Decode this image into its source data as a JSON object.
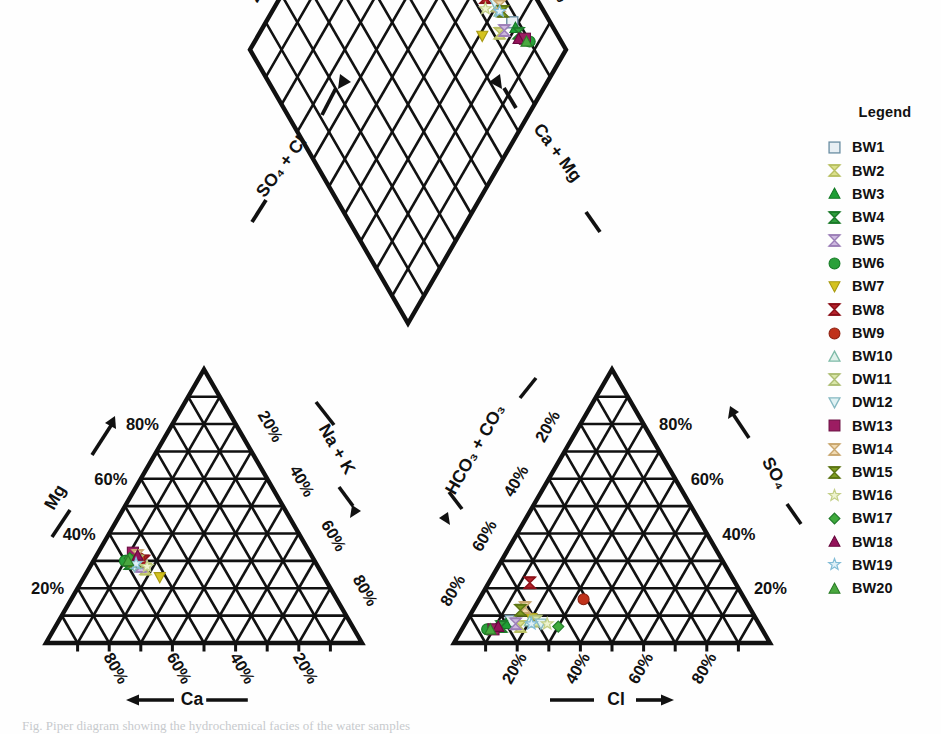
{
  "figure": {
    "type": "piper-trilinear-diagram",
    "caption": "Fig. Piper diagram showing the hydrochemical facies of the water samples"
  },
  "legend": {
    "title": "Legend",
    "items": [
      {
        "label": "BW1",
        "marker": "square-open",
        "color": "#e8eff4",
        "stroke": "#6b8ea3"
      },
      {
        "label": "BW2",
        "marker": "hourglass",
        "color": "#dbe08a",
        "stroke": "#b9c063"
      },
      {
        "label": "BW3",
        "marker": "triangle-up",
        "color": "#1f9e35",
        "stroke": "#147a26"
      },
      {
        "label": "BW4",
        "marker": "hourglass",
        "color": "#2f9e3d",
        "stroke": "#1c7a2a"
      },
      {
        "label": "BW5",
        "marker": "hourglass",
        "color": "#cdb8e0",
        "stroke": "#9c7fb8"
      },
      {
        "label": "BW6",
        "marker": "circle",
        "color": "#2aa03a",
        "stroke": "#157a24"
      },
      {
        "label": "BW7",
        "marker": "triangle-down",
        "color": "#d4c21f",
        "stroke": "#a89a12"
      },
      {
        "label": "BW8",
        "marker": "hourglass",
        "color": "#b5232c",
        "stroke": "#8c1018"
      },
      {
        "label": "BW9",
        "marker": "circle",
        "color": "#c0321b",
        "stroke": "#8d2010"
      },
      {
        "label": "BW10",
        "marker": "triangle-up-open",
        "color": "#dff1ea",
        "stroke": "#7fbba8"
      },
      {
        "label": "DW11",
        "marker": "hourglass",
        "color": "#d9e6a8",
        "stroke": "#aebe74"
      },
      {
        "label": "DW12",
        "marker": "triangle-down-open",
        "color": "#e0f2f4",
        "stroke": "#86b9c2"
      },
      {
        "label": "BW13",
        "marker": "square",
        "color": "#9c1c62",
        "stroke": "#6d0f43"
      },
      {
        "label": "BW14",
        "marker": "hourglass",
        "color": "#f0d9b0",
        "stroke": "#c9a76f"
      },
      {
        "label": "BW15",
        "marker": "hourglass",
        "color": "#7f9e22",
        "stroke": "#5d7515"
      },
      {
        "label": "BW16",
        "marker": "star-open",
        "color": "#eef3cf",
        "stroke": "#c3cf88"
      },
      {
        "label": "BW17",
        "marker": "diamond",
        "color": "#3faa3c",
        "stroke": "#21792a"
      },
      {
        "label": "BW18",
        "marker": "triangle-up",
        "color": "#94125a",
        "stroke": "#68093e"
      },
      {
        "label": "BW19",
        "marker": "star-open",
        "color": "#dff0f7",
        "stroke": "#82bcd6"
      },
      {
        "label": "BW20",
        "marker": "triangle-up",
        "color": "#4aa83f",
        "stroke": "#2a7c27"
      }
    ]
  },
  "axes": {
    "diamond": {
      "left_title": "SO₄ + Cl",
      "right_title": "Ca + Mg",
      "left_ticks": [
        "20%",
        "40%",
        "60%",
        "80%"
      ],
      "right_ticks": [
        "20%",
        "40%",
        "60%",
        "80%"
      ]
    },
    "cation_triangle": {
      "left_title": "Mg",
      "right_title": "Na + K",
      "bottom_title": "Ca",
      "left_ticks": [
        "20%",
        "40%",
        "60%",
        "80%"
      ],
      "right_ticks": [
        "20%",
        "40%",
        "60%",
        "80%"
      ],
      "bottom_ticks": [
        "80%",
        "60%",
        "40%",
        "20%"
      ]
    },
    "anion_triangle": {
      "left_title": "HCO₃ + CO₃",
      "right_title": "SO₄",
      "bottom_title": "Cl",
      "left_ticks": [
        "20%",
        "40%",
        "60%",
        "80%"
      ],
      "right_ticks": [
        "80%",
        "60%",
        "40%",
        "20%"
      ],
      "bottom_ticks": [
        "20%",
        "40%",
        "60%",
        "80%"
      ]
    }
  },
  "chart_data": {
    "type": "scatter",
    "title": "",
    "xlabel": "",
    "ylabel": "",
    "grid": true,
    "legend_position": "right",
    "axis_range_percent": [
      0,
      100
    ],
    "series": [
      {
        "name": "BW1",
        "cation": {
          "ca": 58,
          "mg": 30,
          "na_k": 12
        },
        "anion": {
          "cl": 14,
          "so4": 8,
          "hco3_co3": 78
        }
      },
      {
        "name": "BW2",
        "cation": {
          "ca": 55,
          "mg": 27,
          "na_k": 18
        },
        "anion": {
          "cl": 18,
          "so4": 6,
          "hco3_co3": 76
        }
      },
      {
        "name": "BW3",
        "cation": {
          "ca": 57,
          "mg": 31,
          "na_k": 12
        },
        "anion": {
          "cl": 13,
          "so4": 7,
          "hco3_co3": 80
        }
      },
      {
        "name": "BW4",
        "cation": {
          "ca": 59,
          "mg": 29,
          "na_k": 12
        },
        "anion": {
          "cl": 12,
          "so4": 6,
          "hco3_co3": 82
        }
      },
      {
        "name": "BW5",
        "cation": {
          "ca": 56,
          "mg": 28,
          "na_k": 16
        },
        "anion": {
          "cl": 16,
          "so4": 7,
          "hco3_co3": 77
        }
      },
      {
        "name": "BW6",
        "cation": {
          "ca": 60,
          "mg": 30,
          "na_k": 10
        },
        "anion": {
          "cl": 8,
          "so4": 5,
          "hco3_co3": 87
        }
      },
      {
        "name": "BW7",
        "cation": {
          "ca": 52,
          "mg": 24,
          "na_k": 24
        },
        "anion": {
          "cl": 20,
          "so4": 9,
          "hco3_co3": 71
        }
      },
      {
        "name": "BW8",
        "cation": {
          "ca": 54,
          "mg": 30,
          "na_k": 16
        },
        "anion": {
          "cl": 13,
          "so4": 22,
          "hco3_co3": 65
        }
      },
      {
        "name": "BW9",
        "cation": {
          "ca": 55,
          "mg": 31,
          "na_k": 14
        },
        "anion": {
          "cl": 33,
          "so4": 16,
          "hco3_co3": 51
        }
      },
      {
        "name": "BW10",
        "cation": {
          "ca": 57,
          "mg": 29,
          "na_k": 14
        },
        "anion": {
          "cl": 20,
          "so4": 8,
          "hco3_co3": 72
        }
      },
      {
        "name": "DW11",
        "cation": {
          "ca": 56,
          "mg": 30,
          "na_k": 14
        },
        "anion": {
          "cl": 22,
          "so4": 8,
          "hco3_co3": 70
        }
      },
      {
        "name": "DW12",
        "cation": {
          "ca": 58,
          "mg": 28,
          "na_k": 14
        },
        "anion": {
          "cl": 24,
          "so4": 7,
          "hco3_co3": 69
        }
      },
      {
        "name": "BW13",
        "cation": {
          "ca": 56,
          "mg": 33,
          "na_k": 11
        },
        "anion": {
          "cl": 10,
          "so4": 5,
          "hco3_co3": 85
        }
      },
      {
        "name": "BW14",
        "cation": {
          "ca": 55,
          "mg": 32,
          "na_k": 13
        },
        "anion": {
          "cl": 16,
          "so4": 13,
          "hco3_co3": 71
        }
      },
      {
        "name": "BW15",
        "cation": {
          "ca": 57,
          "mg": 30,
          "na_k": 13
        },
        "anion": {
          "cl": 15,
          "so4": 12,
          "hco3_co3": 73
        }
      },
      {
        "name": "BW16",
        "cation": {
          "ca": 54,
          "mg": 28,
          "na_k": 18
        },
        "anion": {
          "cl": 26,
          "so4": 7,
          "hco3_co3": 67
        }
      },
      {
        "name": "BW17",
        "cation": {
          "ca": 58,
          "mg": 31,
          "na_k": 11
        },
        "anion": {
          "cl": 30,
          "so4": 6,
          "hco3_co3": 64
        }
      },
      {
        "name": "BW18",
        "cation": {
          "ca": 55,
          "mg": 32,
          "na_k": 13
        },
        "anion": {
          "cl": 11,
          "so4": 6,
          "hco3_co3": 83
        }
      },
      {
        "name": "BW19",
        "cation": {
          "ca": 57,
          "mg": 29,
          "na_k": 14
        },
        "anion": {
          "cl": 21,
          "so4": 7,
          "hco3_co3": 72
        }
      },
      {
        "name": "BW20",
        "cation": {
          "ca": 59,
          "mg": 30,
          "na_k": 11
        },
        "anion": {
          "cl": 9,
          "so4": 5,
          "hco3_co3": 86
        }
      }
    ]
  }
}
